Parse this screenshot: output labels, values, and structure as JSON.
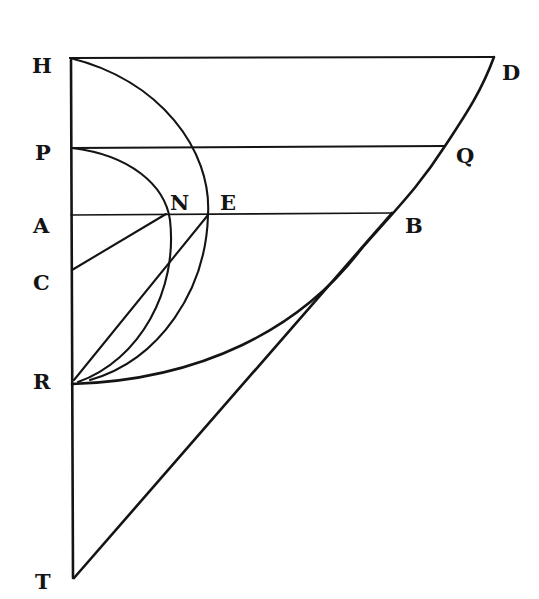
{
  "figure": {
    "points": {
      "H": "H",
      "D": "D",
      "P": "P",
      "Q": "Q",
      "A": "A",
      "N": "N",
      "E": "E",
      "B": "B",
      "C": "C",
      "R": "R",
      "T": "T"
    },
    "colors": {
      "ink": "#141414",
      "paper": "#ffffff"
    }
  }
}
